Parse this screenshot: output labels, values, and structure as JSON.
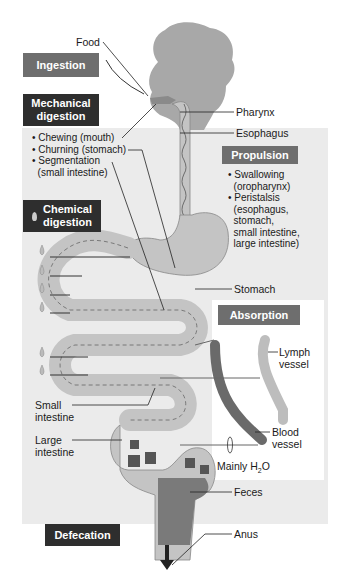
{
  "diagram": {
    "stages": {
      "ingestion": "Ingestion",
      "mechanical": [
        "Mechanical",
        "digestion"
      ],
      "chemical": [
        "Chemical",
        "digestion"
      ],
      "propulsion": "Propulsion",
      "absorption": "Absorption",
      "defecation": "Defecation"
    },
    "mechanical_items": [
      "• Chewing (mouth)",
      "• Churning (stomach)",
      "• Segmentation",
      "  (small intestine)"
    ],
    "propulsion_items": [
      "• Swallowing",
      "  (oropharynx)",
      "• Peristalsis",
      "  (esophagus,",
      "  stomach,",
      "  small intestine,",
      "  large intestine)"
    ],
    "anatomy_labels": {
      "food": "Food",
      "pharynx": "Pharynx",
      "esophagus": "Esophagus",
      "stomach": "Stomach",
      "lymph": [
        "Lymph",
        "vessel"
      ],
      "blood": [
        "Blood",
        "vessel"
      ],
      "small_intestine": [
        "Small",
        "intestine"
      ],
      "large_intestine": [
        "Large",
        "intestine"
      ],
      "water": "Mainly H",
      "water_sub": "2",
      "water_end": "O",
      "feces": "Feces",
      "anus": "Anus"
    },
    "colors": {
      "dark_box": "#2e2e2e",
      "mid_box": "#6e6e6e",
      "panel": "#ebebeb",
      "tract": "#c4c4c4",
      "feces": "#7a7a7a",
      "blood_vessel": "#6a6a6a",
      "lymph_vessel": "#bdbdbd"
    }
  }
}
